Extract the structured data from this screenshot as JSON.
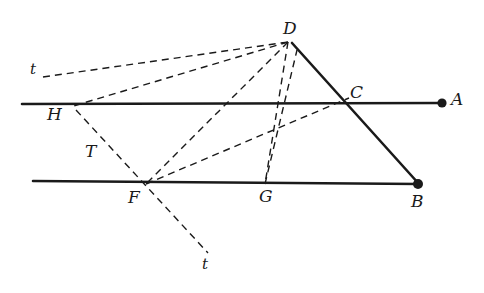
{
  "figure": {
    "type": "geometric-diagram",
    "width": 484,
    "height": 293,
    "background_color": "#ffffff",
    "stroke_color": "#1a1a1a",
    "labels": [
      {
        "id": "D",
        "text": "D",
        "x": 288,
        "y": 28
      },
      {
        "id": "t_top",
        "text": "t",
        "x": 33,
        "y": 71
      },
      {
        "id": "C",
        "text": "C",
        "x": 356,
        "y": 93
      },
      {
        "id": "A",
        "text": "A",
        "x": 456,
        "y": 100
      },
      {
        "id": "H",
        "text": "H",
        "x": 53,
        "y": 115
      },
      {
        "id": "T",
        "text": "T",
        "x": 90,
        "y": 152
      },
      {
        "id": "F",
        "text": "F",
        "x": 133,
        "y": 198
      },
      {
        "id": "G",
        "text": "G",
        "x": 264,
        "y": 197
      },
      {
        "id": "B",
        "text": "B",
        "x": 416,
        "y": 202
      },
      {
        "id": "t_bottom",
        "text": "t",
        "x": 205,
        "y": 265
      }
    ],
    "points": [
      {
        "id": "A-dot",
        "x": 442,
        "y": 103,
        "filled": true
      },
      {
        "id": "B-dot",
        "x": 418,
        "y": 184,
        "filled": true
      }
    ],
    "solid_lines": [
      {
        "id": "line-HA",
        "x1": 22,
        "y1": 104,
        "x2": 445,
        "y2": 103
      },
      {
        "id": "line-FB",
        "x1": 33,
        "y1": 181,
        "x2": 421,
        "y2": 184
      },
      {
        "id": "line-DB",
        "x1": 292,
        "y1": 43,
        "x2": 419,
        "y2": 184
      }
    ],
    "dashed_lines": [
      {
        "id": "dash-t-top-to-D",
        "x1": 43,
        "y1": 77,
        "x2": 288,
        "y2": 42
      },
      {
        "id": "dash-D-to-H",
        "x1": 288,
        "y1": 42,
        "x2": 70,
        "y2": 107
      },
      {
        "id": "dash-D-to-T-F",
        "x1": 288,
        "y1": 42,
        "x2": 146,
        "y2": 183
      },
      {
        "id": "dash-D-to-G",
        "x1": 288,
        "y1": 42,
        "x2": 265,
        "y2": 183
      },
      {
        "id": "dash-T-to-t-bottom",
        "x1": 76,
        "y1": 108,
        "x2": 208,
        "y2": 253
      },
      {
        "id": "dash-F-to-C",
        "x1": 146,
        "y1": 183,
        "x2": 347,
        "y2": 99
      },
      {
        "id": "dash-G-to-D-lower",
        "x1": 265,
        "y1": 183,
        "x2": 300,
        "y2": 55
      },
      {
        "id": "dash-F-to-B",
        "x1": 146,
        "y1": 183,
        "x2": 415,
        "y2": 182
      }
    ]
  }
}
